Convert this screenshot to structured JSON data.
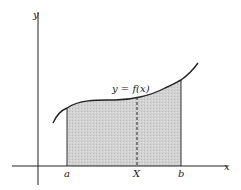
{
  "diagram": {
    "axes": {
      "x_label": "x",
      "y_label": "y"
    },
    "curve_label": "y = f(x)",
    "points": {
      "a": "a",
      "X": "X",
      "b": "b"
    },
    "colors": {
      "shade": "#cfcfcf",
      "line": "#222222",
      "background": "#ffffff"
    }
  }
}
